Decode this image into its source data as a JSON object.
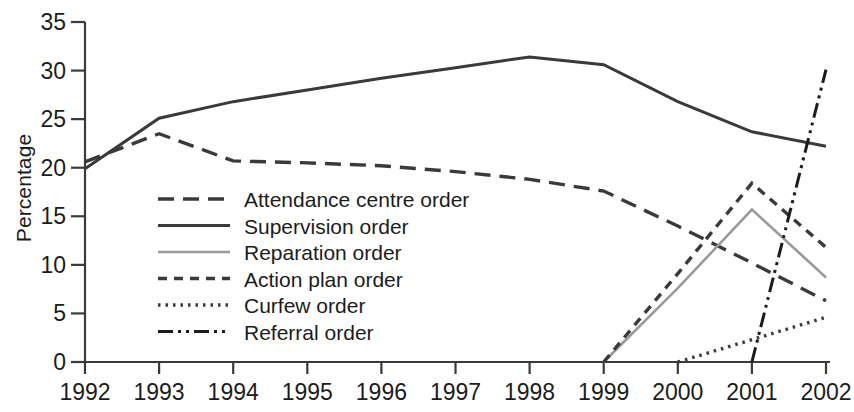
{
  "chart_data": {
    "type": "line",
    "title": "",
    "xlabel": "",
    "ylabel": "Percentage",
    "x": [
      1992,
      1993,
      1994,
      1995,
      1996,
      1997,
      1998,
      1999,
      2000,
      2001,
      2002
    ],
    "xticklabels": [
      "1992",
      "1993",
      "1994",
      "1995",
      "1996",
      "1997",
      "1998",
      "1999",
      "2000",
      "2001",
      "2002"
    ],
    "yticklabels": [
      "0",
      "5",
      "10",
      "15",
      "20",
      "25",
      "30",
      "35"
    ],
    "ytickvalues": [
      0,
      5,
      10,
      15,
      20,
      25,
      30,
      35
    ],
    "ylim": [
      0,
      35
    ],
    "xlim": [
      1992,
      2002
    ],
    "grid": false,
    "legend_position": "center-left inside axes",
    "series": [
      {
        "name": "Attendance centre order",
        "style": "long-dash",
        "color": "#3a3a3a",
        "x": [
          1992,
          1993,
          1994,
          1995,
          1996,
          1997,
          1998,
          1999,
          2000,
          2001,
          2002
        ],
        "values": [
          20.6,
          23.5,
          20.7,
          20.5,
          20.2,
          19.6,
          18.8,
          17.6,
          14.0,
          10.2,
          6.3
        ]
      },
      {
        "name": "Supervision order",
        "style": "solid",
        "color": "#3a3a3a",
        "x": [
          1992,
          1993,
          1994,
          1995,
          1996,
          1997,
          1998,
          1999,
          2000,
          2001,
          2002
        ],
        "values": [
          19.9,
          25.1,
          26.8,
          28.0,
          29.2,
          30.3,
          31.4,
          30.6,
          26.8,
          23.7,
          22.2
        ]
      },
      {
        "name": "Reparation order",
        "style": "solid-light",
        "color": "#9a9a9a",
        "x": [
          1999,
          2000,
          2001,
          2002
        ],
        "values": [
          0.0,
          7.6,
          15.7,
          8.7
        ]
      },
      {
        "name": "Action plan order",
        "style": "short-dash",
        "color": "#3a3a3a",
        "x": [
          1999,
          2000,
          2001,
          2002
        ],
        "values": [
          0.0,
          9.1,
          18.4,
          11.8
        ]
      },
      {
        "name": "Curfew order",
        "style": "dotted",
        "color": "#3a3a3a",
        "x": [
          2000,
          2001,
          2002
        ],
        "values": [
          0.0,
          2.3,
          4.6
        ]
      },
      {
        "name": "Referral order",
        "style": "dash-dot-dot",
        "color": "#1c1c1c",
        "x": [
          2001,
          2002
        ],
        "values": [
          0.0,
          30.1
        ]
      }
    ]
  },
  "legend": {
    "items": [
      {
        "label": "Attendance centre order"
      },
      {
        "label": "Supervision order"
      },
      {
        "label": "Reparation order"
      },
      {
        "label": "Action plan order"
      },
      {
        "label": "Curfew order"
      },
      {
        "label": "Referral order"
      }
    ]
  }
}
